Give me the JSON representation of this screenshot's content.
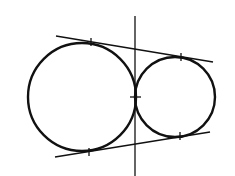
{
  "diagram": {
    "title": "",
    "stroke_color": "#111111",
    "background": "#ffffff",
    "circles": [
      {
        "id": "large",
        "cx": 82,
        "cy": 97,
        "r": 54
      },
      {
        "id": "small",
        "cx": 175,
        "cy": 97,
        "r": 40
      }
    ],
    "lines": [
      {
        "id": "top-tangent",
        "x1": 56,
        "y1": 36,
        "x2": 213,
        "y2": 62
      },
      {
        "id": "bottom-tangent",
        "x1": 55,
        "y1": 157,
        "x2": 210,
        "y2": 132
      },
      {
        "id": "vertical-tangent",
        "x1": 135,
        "y1": 16,
        "x2": 135,
        "y2": 176
      }
    ],
    "tick_marks": [
      {
        "id": "tick-large-top",
        "x1": 91,
        "y1": 38,
        "x2": 91,
        "y2": 46
      },
      {
        "id": "tick-small-top",
        "x1": 181,
        "y1": 53,
        "x2": 181,
        "y2": 61
      },
      {
        "id": "tick-contact",
        "x1": 130,
        "y1": 97,
        "x2": 141,
        "y2": 97
      },
      {
        "id": "tick-large-bottom",
        "x1": 89,
        "y1": 148,
        "x2": 89,
        "y2": 156
      },
      {
        "id": "tick-small-bottom",
        "x1": 180,
        "y1": 132,
        "x2": 180,
        "y2": 140
      }
    ]
  }
}
